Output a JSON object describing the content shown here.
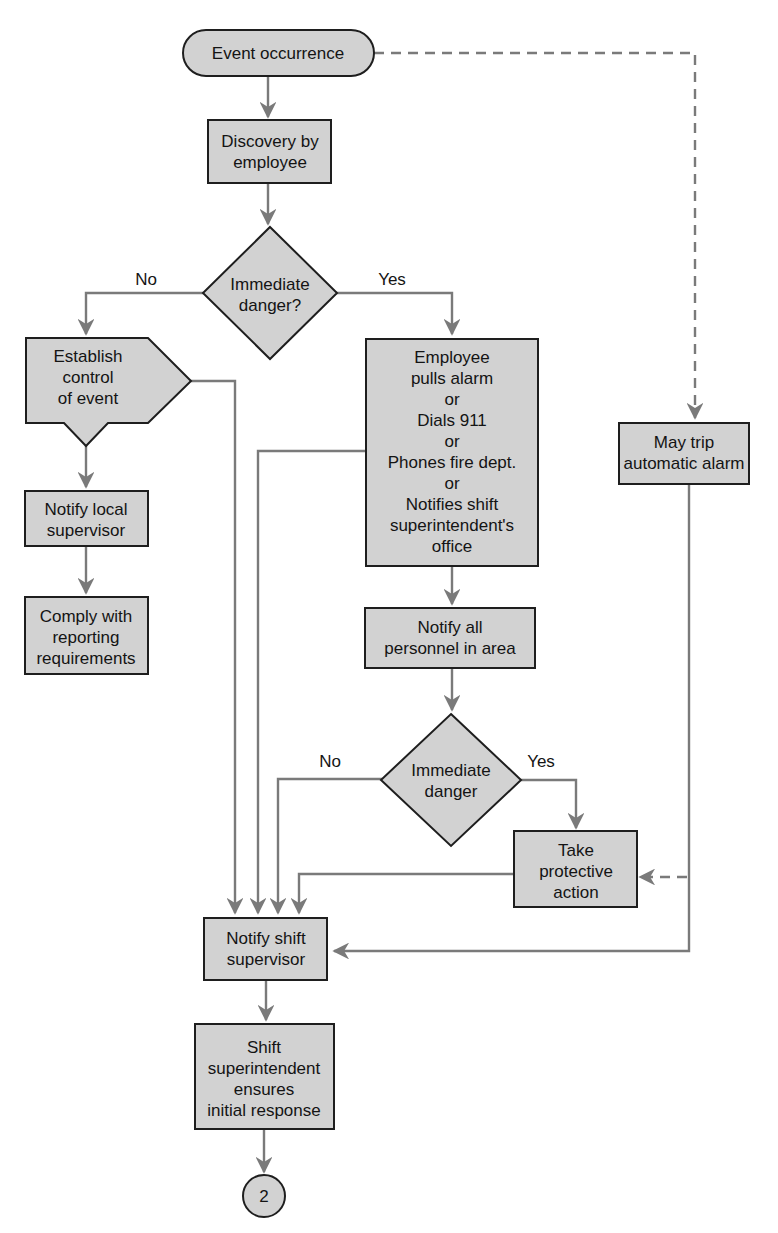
{
  "diagram": {
    "type": "flowchart",
    "colors": {
      "node_fill": "#d2d2d2",
      "node_stroke": "#1e1e1e",
      "connector": "#7a7a7a",
      "text": "#141414"
    },
    "nodes": {
      "start": {
        "shape": "terminator",
        "lines": [
          "Event occurrence"
        ]
      },
      "discovery": {
        "shape": "process",
        "lines": [
          "Discovery by",
          "employee"
        ]
      },
      "decision1": {
        "shape": "decision",
        "lines": [
          "Immediate",
          "danger?"
        ]
      },
      "establish": {
        "shape": "pentagon-down",
        "lines": [
          "Establish",
          "control",
          "of event"
        ]
      },
      "notify_local": {
        "shape": "process",
        "lines": [
          "Notify local",
          "supervisor"
        ]
      },
      "comply": {
        "shape": "process",
        "lines": [
          "Comply with",
          "reporting",
          "requirements"
        ]
      },
      "employee_alarm": {
        "shape": "process",
        "lines": [
          "Employee",
          "pulls alarm",
          "or",
          "Dials 911",
          "or",
          "Phones fire dept.",
          "or",
          "Notifies shift",
          "superintendent's",
          "office"
        ]
      },
      "auto_alarm": {
        "shape": "process",
        "lines": [
          "May trip",
          "automatic alarm"
        ]
      },
      "notify_all": {
        "shape": "process",
        "lines": [
          "Notify all",
          "personnel in area"
        ]
      },
      "decision2": {
        "shape": "decision",
        "lines": [
          "Immediate",
          "danger"
        ]
      },
      "protective": {
        "shape": "process",
        "lines": [
          "Take",
          "protective",
          "action"
        ]
      },
      "notify_shift": {
        "shape": "process",
        "lines": [
          "Notify shift",
          "supervisor"
        ]
      },
      "superintendent": {
        "shape": "process",
        "lines": [
          "Shift",
          "superintendent",
          "ensures",
          "initial response"
        ]
      },
      "connector2": {
        "shape": "connector",
        "lines": [
          "2"
        ]
      }
    },
    "edge_labels": {
      "d1_no": "No",
      "d1_yes": "Yes",
      "d2_no": "No",
      "d2_yes": "Yes"
    },
    "edges": [
      {
        "from": "start",
        "to": "discovery",
        "style": "solid"
      },
      {
        "from": "start",
        "to": "auto_alarm",
        "style": "dashed"
      },
      {
        "from": "discovery",
        "to": "decision1",
        "style": "solid"
      },
      {
        "from": "decision1",
        "to": "establish",
        "label": "No",
        "style": "solid"
      },
      {
        "from": "decision1",
        "to": "employee_alarm",
        "label": "Yes",
        "style": "solid"
      },
      {
        "from": "establish",
        "to": "notify_local",
        "style": "solid"
      },
      {
        "from": "establish",
        "to": "notify_shift",
        "style": "solid"
      },
      {
        "from": "notify_local",
        "to": "comply",
        "style": "solid"
      },
      {
        "from": "employee_alarm",
        "to": "notify_all",
        "style": "solid"
      },
      {
        "from": "employee_alarm",
        "to": "notify_shift",
        "style": "solid"
      },
      {
        "from": "notify_all",
        "to": "decision2",
        "style": "solid"
      },
      {
        "from": "decision2",
        "to": "notify_shift",
        "label": "No",
        "style": "solid"
      },
      {
        "from": "decision2",
        "to": "protective",
        "label": "Yes",
        "style": "solid"
      },
      {
        "from": "protective",
        "to": "notify_shift",
        "style": "solid"
      },
      {
        "from": "auto_alarm",
        "to": "notify_shift",
        "style": "solid"
      },
      {
        "from": "auto_alarm",
        "to": "protective",
        "style": "dashed"
      },
      {
        "from": "notify_shift",
        "to": "superintendent",
        "style": "solid"
      },
      {
        "from": "superintendent",
        "to": "connector2",
        "style": "solid"
      }
    ]
  }
}
